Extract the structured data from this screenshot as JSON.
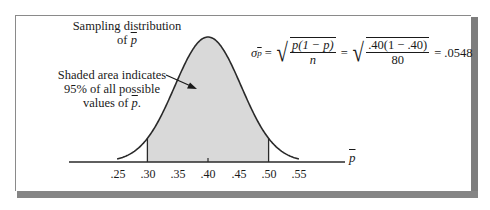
{
  "chart_data": {
    "type": "area",
    "distribution": "normal",
    "mean": 0.4,
    "std_error": 0.0548,
    "n": 80,
    "p": 0.4,
    "xlabel": "p̄",
    "ylabel": "",
    "x_ticks": [
      0.25,
      0.3,
      0.35,
      0.4,
      0.45,
      0.5,
      0.55
    ],
    "x_tick_labels": [
      ".25",
      ".30",
      ".35",
      ".40",
      ".45",
      ".50",
      ".55"
    ],
    "xlim": [
      0.25,
      0.55
    ],
    "shaded_region": {
      "from": 0.3,
      "to": 0.5,
      "fill": "#d9d9d9",
      "percent": "95%"
    },
    "grid": false,
    "annotations": [
      "Sampling distribution of p̄",
      "Shaded area indicates 95% of all possible values of p̄.",
      "σp̄ = √(p(1 − p)/n) = √(.40(1 − .40)/80) = .0548"
    ]
  },
  "labels": {
    "dist_line1": "Sampling distribution",
    "dist_line2_prefix": "of ",
    "pbar": "p",
    "shade_line1": "Shaded area indicates",
    "shade_line2": "95% of all possible",
    "shade_line3_prefix": "values of ",
    "shade_line3_suffix": ".",
    "axis_label": "p"
  },
  "formula": {
    "sigma": "σ",
    "sub": "p",
    "eq": "=",
    "num1": "p(1 − p)",
    "den1": "n",
    "num2": ".40(1 − .40)",
    "den2": "80",
    "result": ".0548"
  },
  "ticks": [
    ".25",
    ".30",
    ".35",
    ".40",
    ".45",
    ".50",
    ".55"
  ],
  "colors": {
    "shade": "#d9d9d9",
    "line": "#2a2a2a",
    "frame_shadow": "#808080"
  }
}
